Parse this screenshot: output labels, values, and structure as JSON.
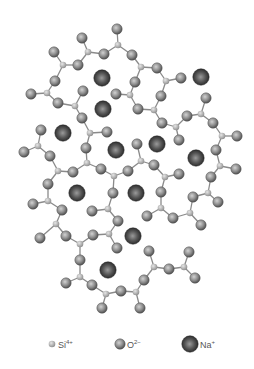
{
  "diagram": {
    "type": "silicate-glass-network",
    "colors": {
      "background": "#ffffff",
      "bond": "#8a8a8a",
      "si_fill": "#b5b5b5",
      "o_fill": "#8c8c8c",
      "na_fill": "#3a3a3a"
    },
    "radii": {
      "si": 3.3,
      "o": 5.2,
      "na": 8.2
    },
    "atoms": [
      {
        "id": "s1",
        "type": "si",
        "x": 88,
        "y": 52
      },
      {
        "id": "s2",
        "type": "si",
        "x": 63,
        "y": 65
      },
      {
        "id": "s3",
        "type": "si",
        "x": 47,
        "y": 93
      },
      {
        "id": "s4",
        "type": "si",
        "x": 75,
        "y": 106
      },
      {
        "id": "s5",
        "type": "si",
        "x": 118,
        "y": 45
      },
      {
        "id": "s6",
        "type": "si",
        "x": 141,
        "y": 67
      },
      {
        "id": "s7",
        "type": "si",
        "x": 166,
        "y": 81
      },
      {
        "id": "s8",
        "type": "si",
        "x": 130,
        "y": 95
      },
      {
        "id": "s9",
        "type": "si",
        "x": 154,
        "y": 110
      },
      {
        "id": "s10",
        "type": "si",
        "x": 201,
        "y": 114
      },
      {
        "id": "s11",
        "type": "si",
        "x": 176,
        "y": 127
      },
      {
        "id": "s12",
        "type": "si",
        "x": 222,
        "y": 136
      },
      {
        "id": "s13",
        "type": "si",
        "x": 90,
        "y": 133
      },
      {
        "id": "s14",
        "type": "si",
        "x": 38,
        "y": 146
      },
      {
        "id": "s15",
        "type": "si",
        "x": 87,
        "y": 163
      },
      {
        "id": "s16",
        "type": "si",
        "x": 58,
        "y": 171
      },
      {
        "id": "s17",
        "type": "si",
        "x": 114,
        "y": 176
      },
      {
        "id": "s18",
        "type": "si",
        "x": 141,
        "y": 161
      },
      {
        "id": "s19",
        "type": "si",
        "x": 165,
        "y": 177
      },
      {
        "id": "s20",
        "type": "si",
        "x": 220,
        "y": 166
      },
      {
        "id": "s21",
        "type": "si",
        "x": 208,
        "y": 193
      },
      {
        "id": "s22",
        "type": "si",
        "x": 48,
        "y": 201
      },
      {
        "id": "s23",
        "type": "si",
        "x": 108,
        "y": 209
      },
      {
        "id": "s24",
        "type": "si",
        "x": 161,
        "y": 208
      },
      {
        "id": "s25",
        "type": "si",
        "x": 190,
        "y": 213
      },
      {
        "id": "s26",
        "type": "si",
        "x": 56,
        "y": 224
      },
      {
        "id": "s27",
        "type": "si",
        "x": 80,
        "y": 244
      },
      {
        "id": "s28",
        "type": "si",
        "x": 109,
        "y": 234
      },
      {
        "id": "s29",
        "type": "si",
        "x": 154,
        "y": 267
      },
      {
        "id": "s30",
        "type": "si",
        "x": 184,
        "y": 267
      },
      {
        "id": "s31",
        "type": "si",
        "x": 80,
        "y": 277
      },
      {
        "id": "s32",
        "type": "si",
        "x": 106,
        "y": 294
      },
      {
        "id": "s33",
        "type": "si",
        "x": 136,
        "y": 292
      },
      {
        "id": "o1",
        "type": "o",
        "x": 82,
        "y": 38
      },
      {
        "id": "o2",
        "type": "o",
        "x": 104,
        "y": 54
      },
      {
        "id": "o3",
        "type": "o",
        "x": 78,
        "y": 65
      },
      {
        "id": "o4",
        "type": "o",
        "x": 54,
        "y": 52
      },
      {
        "id": "o5",
        "type": "o",
        "x": 55,
        "y": 81
      },
      {
        "id": "o6",
        "type": "o",
        "x": 31,
        "y": 94
      },
      {
        "id": "o7",
        "type": "o",
        "x": 58,
        "y": 103
      },
      {
        "id": "o8",
        "type": "o",
        "x": 83,
        "y": 91
      },
      {
        "id": "o9",
        "type": "o",
        "x": 117,
        "y": 29
      },
      {
        "id": "o10",
        "type": "o",
        "x": 132,
        "y": 55
      },
      {
        "id": "o11",
        "type": "o",
        "x": 157,
        "y": 68
      },
      {
        "id": "o12",
        "type": "o",
        "x": 135,
        "y": 82
      },
      {
        "id": "o13",
        "type": "o",
        "x": 181,
        "y": 78
      },
      {
        "id": "o14",
        "type": "o",
        "x": 116,
        "y": 94
      },
      {
        "id": "o15",
        "type": "o",
        "x": 161,
        "y": 96
      },
      {
        "id": "o16",
        "type": "o",
        "x": 138,
        "y": 109
      },
      {
        "id": "o17",
        "type": "o",
        "x": 206,
        "y": 98
      },
      {
        "id": "o18",
        "type": "o",
        "x": 187,
        "y": 116
      },
      {
        "id": "o19",
        "type": "o",
        "x": 162,
        "y": 123
      },
      {
        "id": "o20",
        "type": "o",
        "x": 213,
        "y": 123
      },
      {
        "id": "o21",
        "type": "o",
        "x": 179,
        "y": 140
      },
      {
        "id": "o22",
        "type": "o",
        "x": 237,
        "y": 136
      },
      {
        "id": "o23",
        "type": "o",
        "x": 216,
        "y": 150
      },
      {
        "id": "o24",
        "type": "o",
        "x": 82,
        "y": 118
      },
      {
        "id": "o25",
        "type": "o",
        "x": 107,
        "y": 132
      },
      {
        "id": "o26",
        "type": "o",
        "x": 41,
        "y": 130
      },
      {
        "id": "o27",
        "type": "o",
        "x": 24,
        "y": 152
      },
      {
        "id": "o28",
        "type": "o",
        "x": 50,
        "y": 156
      },
      {
        "id": "o29",
        "type": "o",
        "x": 86,
        "y": 148
      },
      {
        "id": "o30",
        "type": "o",
        "x": 137,
        "y": 144
      },
      {
        "id": "o31",
        "type": "o",
        "x": 73,
        "y": 172
      },
      {
        "id": "o32",
        "type": "o",
        "x": 101,
        "y": 169
      },
      {
        "id": "o33",
        "type": "o",
        "x": 128,
        "y": 171
      },
      {
        "id": "o34",
        "type": "o",
        "x": 154,
        "y": 165
      },
      {
        "id": "o35",
        "type": "o",
        "x": 179,
        "y": 174
      },
      {
        "id": "o36",
        "type": "o",
        "x": 236,
        "y": 169
      },
      {
        "id": "o37",
        "type": "o",
        "x": 211,
        "y": 177
      },
      {
        "id": "o38",
        "type": "o",
        "x": 48,
        "y": 184
      },
      {
        "id": "o39",
        "type": "o",
        "x": 113,
        "y": 193
      },
      {
        "id": "o40",
        "type": "o",
        "x": 161,
        "y": 192
      },
      {
        "id": "o41",
        "type": "o",
        "x": 193,
        "y": 197
      },
      {
        "id": "o42",
        "type": "o",
        "x": 218,
        "y": 202
      },
      {
        "id": "o43",
        "type": "o",
        "x": 33,
        "y": 204
      },
      {
        "id": "o44",
        "type": "o",
        "x": 62,
        "y": 210
      },
      {
        "id": "o45",
        "type": "o",
        "x": 92,
        "y": 211
      },
      {
        "id": "o46",
        "type": "o",
        "x": 147,
        "y": 216
      },
      {
        "id": "o47",
        "type": "o",
        "x": 173,
        "y": 218
      },
      {
        "id": "o48",
        "type": "o",
        "x": 118,
        "y": 221
      },
      {
        "id": "o49",
        "type": "o",
        "x": 201,
        "y": 225
      },
      {
        "id": "o50",
        "type": "o",
        "x": 40,
        "y": 238
      },
      {
        "id": "o51",
        "type": "o",
        "x": 66,
        "y": 236
      },
      {
        "id": "o52",
        "type": "o",
        "x": 93,
        "y": 235
      },
      {
        "id": "o53",
        "type": "o",
        "x": 117,
        "y": 248
      },
      {
        "id": "o54",
        "type": "o",
        "x": 149,
        "y": 251
      },
      {
        "id": "o55",
        "type": "o",
        "x": 169,
        "y": 269
      },
      {
        "id": "o56",
        "type": "o",
        "x": 189,
        "y": 252
      },
      {
        "id": "o57",
        "type": "o",
        "x": 195,
        "y": 278
      },
      {
        "id": "o58",
        "type": "o",
        "x": 80,
        "y": 260
      },
      {
        "id": "o59",
        "type": "o",
        "x": 66,
        "y": 283
      },
      {
        "id": "o60",
        "type": "o",
        "x": 92,
        "y": 285
      },
      {
        "id": "o61",
        "type": "o",
        "x": 121,
        "y": 291
      },
      {
        "id": "o62",
        "type": "o",
        "x": 144,
        "y": 280
      },
      {
        "id": "o63",
        "type": "o",
        "x": 102,
        "y": 308
      },
      {
        "id": "o64",
        "type": "o",
        "x": 140,
        "y": 308
      },
      {
        "id": "n1",
        "type": "na",
        "x": 102,
        "y": 78
      },
      {
        "id": "n2",
        "type": "na",
        "x": 201,
        "y": 77
      },
      {
        "id": "n3",
        "type": "na",
        "x": 103,
        "y": 109
      },
      {
        "id": "n4",
        "type": "na",
        "x": 63,
        "y": 133
      },
      {
        "id": "n5",
        "type": "na",
        "x": 116,
        "y": 150
      },
      {
        "id": "n6",
        "type": "na",
        "x": 157,
        "y": 144
      },
      {
        "id": "n7",
        "type": "na",
        "x": 196,
        "y": 158
      },
      {
        "id": "n8",
        "type": "na",
        "x": 77,
        "y": 193
      },
      {
        "id": "n9",
        "type": "na",
        "x": 136,
        "y": 193
      },
      {
        "id": "n10",
        "type": "na",
        "x": 133,
        "y": 236
      },
      {
        "id": "n11",
        "type": "na",
        "x": 108,
        "y": 270
      }
    ],
    "bonds": [
      [
        "s1",
        "o1"
      ],
      [
        "s1",
        "o2"
      ],
      [
        "s1",
        "o3"
      ],
      [
        "s2",
        "o3"
      ],
      [
        "s2",
        "o4"
      ],
      [
        "s2",
        "o5"
      ],
      [
        "s3",
        "o5"
      ],
      [
        "s3",
        "o6"
      ],
      [
        "s3",
        "o7"
      ],
      [
        "s4",
        "o7"
      ],
      [
        "s4",
        "o8"
      ],
      [
        "s4",
        "o24"
      ],
      [
        "s5",
        "o9"
      ],
      [
        "s5",
        "o2"
      ],
      [
        "s5",
        "o10"
      ],
      [
        "s6",
        "o10"
      ],
      [
        "s6",
        "o11"
      ],
      [
        "s6",
        "o12"
      ],
      [
        "s7",
        "o11"
      ],
      [
        "s7",
        "o13"
      ],
      [
        "s7",
        "o15"
      ],
      [
        "s8",
        "o12"
      ],
      [
        "s8",
        "o14"
      ],
      [
        "s8",
        "o16"
      ],
      [
        "s9",
        "o15"
      ],
      [
        "s9",
        "o16"
      ],
      [
        "s9",
        "o19"
      ],
      [
        "s10",
        "o17"
      ],
      [
        "s10",
        "o18"
      ],
      [
        "s10",
        "o20"
      ],
      [
        "s11",
        "o18"
      ],
      [
        "s11",
        "o19"
      ],
      [
        "s11",
        "o21"
      ],
      [
        "s12",
        "o20"
      ],
      [
        "s12",
        "o22"
      ],
      [
        "s12",
        "o23"
      ],
      [
        "s13",
        "o24"
      ],
      [
        "s13",
        "o25"
      ],
      [
        "s13",
        "o29"
      ],
      [
        "s14",
        "o26"
      ],
      [
        "s14",
        "o27"
      ],
      [
        "s14",
        "o28"
      ],
      [
        "s15",
        "o29"
      ],
      [
        "s15",
        "o31"
      ],
      [
        "s15",
        "o32"
      ],
      [
        "s16",
        "o28"
      ],
      [
        "s16",
        "o31"
      ],
      [
        "s16",
        "o38"
      ],
      [
        "s17",
        "o32"
      ],
      [
        "s17",
        "o33"
      ],
      [
        "s17",
        "o39"
      ],
      [
        "s18",
        "o30"
      ],
      [
        "s18",
        "o33"
      ],
      [
        "s18",
        "o34"
      ],
      [
        "s19",
        "o34"
      ],
      [
        "s19",
        "o35"
      ],
      [
        "s19",
        "o40"
      ],
      [
        "s20",
        "o23"
      ],
      [
        "s20",
        "o36"
      ],
      [
        "s20",
        "o37"
      ],
      [
        "s21",
        "o37"
      ],
      [
        "s21",
        "o41"
      ],
      [
        "s21",
        "o42"
      ],
      [
        "s22",
        "o38"
      ],
      [
        "s22",
        "o43"
      ],
      [
        "s22",
        "o44"
      ],
      [
        "s23",
        "o39"
      ],
      [
        "s23",
        "o45"
      ],
      [
        "s23",
        "o48"
      ],
      [
        "s24",
        "o40"
      ],
      [
        "s24",
        "o46"
      ],
      [
        "s24",
        "o47"
      ],
      [
        "s25",
        "o41"
      ],
      [
        "s25",
        "o47"
      ],
      [
        "s25",
        "o49"
      ],
      [
        "s26",
        "o44"
      ],
      [
        "s26",
        "o50"
      ],
      [
        "s26",
        "o51"
      ],
      [
        "s27",
        "o51"
      ],
      [
        "s27",
        "o52"
      ],
      [
        "s27",
        "o58"
      ],
      [
        "s28",
        "o48"
      ],
      [
        "s28",
        "o52"
      ],
      [
        "s28",
        "o53"
      ],
      [
        "s29",
        "o54"
      ],
      [
        "s29",
        "o55"
      ],
      [
        "s29",
        "o62"
      ],
      [
        "s30",
        "o55"
      ],
      [
        "s30",
        "o56"
      ],
      [
        "s30",
        "o57"
      ],
      [
        "s31",
        "o58"
      ],
      [
        "s31",
        "o59"
      ],
      [
        "s31",
        "o60"
      ],
      [
        "s32",
        "o60"
      ],
      [
        "s32",
        "o61"
      ],
      [
        "s32",
        "o63"
      ],
      [
        "s33",
        "o61"
      ],
      [
        "s33",
        "o62"
      ],
      [
        "s33",
        "o64"
      ]
    ]
  },
  "legend": {
    "items": [
      {
        "type": "si",
        "label": "Si",
        "superscript": "4+",
        "marker_x": 52,
        "marker_y": 344,
        "text_x": 58
      },
      {
        "type": "o",
        "label": "O",
        "superscript": "2−",
        "marker_x": 120,
        "marker_y": 344,
        "text_x": 127
      },
      {
        "type": "na",
        "label": "Na",
        "superscript": "+",
        "marker_x": 190,
        "marker_y": 344,
        "text_x": 200
      }
    ]
  }
}
